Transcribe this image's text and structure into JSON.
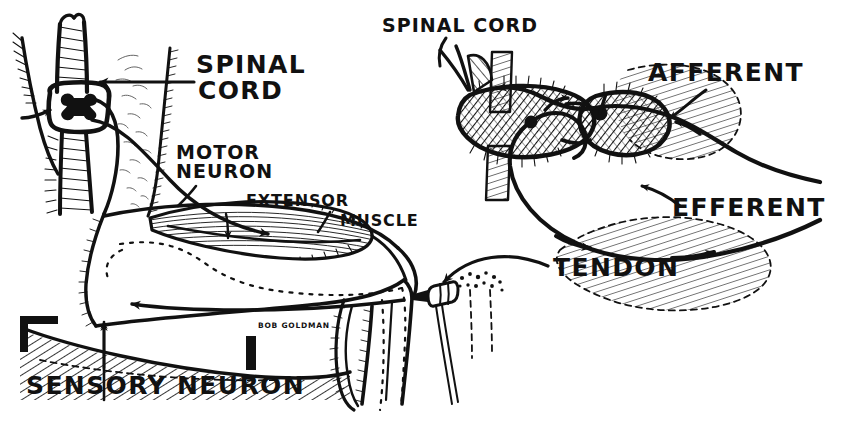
{
  "figure": {
    "background_color": "#ffffff",
    "ink_color": "#111111",
    "width": 852,
    "height": 428,
    "signature": "BOB GOLDMAN"
  },
  "labels": {
    "spinal_cord_left_line1": "SPINAL",
    "spinal_cord_left_line2": "CORD",
    "motor_neuron_line1": "MOTOR",
    "motor_neuron_line2": "NEURON",
    "extensor": "EXTENSOR",
    "muscle": "MUSCLE",
    "spinal_cord_right": "SPINAL CORD",
    "afferent": "AFFERENT",
    "efferent": "EFFERENT",
    "tendon": "TENDON",
    "sensory_neuron": "SENSORY NEURON"
  },
  "panels": [
    {
      "id": "left-panel",
      "name": "whole-body-reflex-arc",
      "description": "Seated figure in profile: vertebral column with spinal cord cross-section at upper left, thigh and lower leg, extensor muscle of the thigh, patellar tendon struck by a reflex hammer, with motor neuron and sensory neuron pathways drawn as arrowed lines.",
      "callouts": [
        "SPINAL CORD",
        "MOTOR NEURON",
        "EXTENSOR MUSCLE",
        "TENDON",
        "SENSORY NEURON"
      ]
    },
    {
      "id": "right-panel",
      "name": "spinal-cord-cross-section-detail",
      "description": "Enlarged cross-section of the spinal cord with hatched gray matter butterfly, showing afferent (sensory) fibre entering the dorsal horn and efferent (motor) fibre leaving the ventral horn; two neuron cell bodies drawn as solid dots.",
      "callouts": [
        "SPINAL CORD",
        "AFFERENT",
        "EFFERENT"
      ]
    }
  ],
  "pathways": [
    {
      "name": "afferent-sensory-pathway",
      "label": "AFFERENT",
      "direction": "toward spinal cord",
      "marker": "arrowhead"
    },
    {
      "name": "efferent-motor-pathway",
      "label": "EFFERENT",
      "direction": "away from spinal cord",
      "marker": "arrowhead"
    }
  ]
}
